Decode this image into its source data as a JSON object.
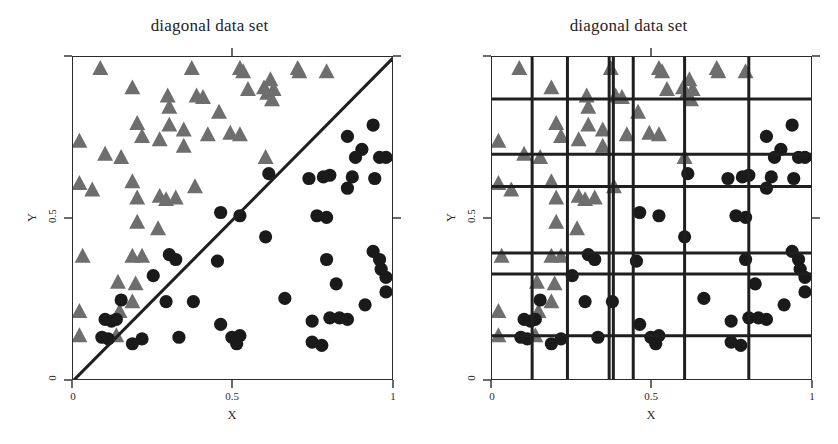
{
  "figure": {
    "width": 838,
    "height": 444,
    "background": "#ffffff"
  },
  "panels": [
    {
      "id": "left",
      "title": "diagonal data set",
      "xlabel": "X",
      "ylabel": "Y",
      "xticks": [
        "0",
        "0.5",
        "1"
      ],
      "yticks": [
        "0",
        "0.5",
        "1"
      ],
      "has_decision_line": true,
      "has_grid_partition": false
    },
    {
      "id": "right",
      "title": "diagonal data set",
      "xlabel": "X",
      "ylabel": "Y",
      "xticks": [
        "0",
        "0.5",
        "1"
      ],
      "yticks": [
        "0",
        "0.5",
        "1"
      ],
      "has_decision_line": false,
      "has_grid_partition": true
    }
  ],
  "chart_data": {
    "type": "scatter",
    "title": "diagonal data set",
    "xlabel": "X",
    "ylabel": "Y",
    "xlim": [
      0,
      1
    ],
    "ylim": [
      0,
      1
    ],
    "xticks": [
      0,
      0.5,
      1
    ],
    "yticks": [
      0,
      0.5,
      1
    ],
    "xtick_labels": [
      "0",
      "0.5",
      "1"
    ],
    "ytick_labels": [
      "0",
      "0.5",
      "1"
    ],
    "grid": false,
    "legend": "none",
    "colors": {
      "class_triangle": "#6e6e6e",
      "class_circle": "#1a1a1a",
      "decision_line": "#1f1f1f",
      "partition_line": "#1f1f1f",
      "axis": "#2b2b2b",
      "background": "#ffffff"
    },
    "series": [
      {
        "name": "class A",
        "marker": "triangle",
        "color": "#6e6e6e",
        "points": [
          [
            0.085,
            0.965
          ],
          [
            0.185,
            0.905
          ],
          [
            0.295,
            0.88
          ],
          [
            0.3,
            0.845
          ],
          [
            0.37,
            0.965
          ],
          [
            0.385,
            0.88
          ],
          [
            0.405,
            0.875
          ],
          [
            0.455,
            0.83
          ],
          [
            0.52,
            0.965
          ],
          [
            0.53,
            0.955
          ],
          [
            0.545,
            0.9
          ],
          [
            0.595,
            0.905
          ],
          [
            0.605,
            0.888
          ],
          [
            0.615,
            0.93
          ],
          [
            0.62,
            0.868
          ],
          [
            0.625,
            0.9
          ],
          [
            0.7,
            0.965
          ],
          [
            0.705,
            0.955
          ],
          [
            0.79,
            0.955
          ],
          [
            0.2,
            0.795
          ],
          [
            0.3,
            0.79
          ],
          [
            0.215,
            0.755
          ],
          [
            0.27,
            0.745
          ],
          [
            0.02,
            0.74
          ],
          [
            0.1,
            0.7
          ],
          [
            0.15,
            0.69
          ],
          [
            0.345,
            0.775
          ],
          [
            0.42,
            0.76
          ],
          [
            0.49,
            0.765
          ],
          [
            0.52,
            0.76
          ],
          [
            0.345,
            0.725
          ],
          [
            0.6,
            0.69
          ],
          [
            0.02,
            0.61
          ],
          [
            0.06,
            0.59
          ],
          [
            0.185,
            0.615
          ],
          [
            0.2,
            0.565
          ],
          [
            0.27,
            0.57
          ],
          [
            0.29,
            0.56
          ],
          [
            0.32,
            0.565
          ],
          [
            0.38,
            0.6
          ],
          [
            0.2,
            0.49
          ],
          [
            0.265,
            0.47
          ],
          [
            0.03,
            0.385
          ],
          [
            0.185,
            0.385
          ],
          [
            0.215,
            0.385
          ],
          [
            0.14,
            0.305
          ],
          [
            0.195,
            0.3
          ],
          [
            0.185,
            0.245
          ],
          [
            0.02,
            0.215
          ],
          [
            0.145,
            0.215
          ],
          [
            0.02,
            0.14
          ],
          [
            0.135,
            0.14
          ]
        ]
      },
      {
        "name": "class B",
        "marker": "circle",
        "color": "#1a1a1a",
        "points": [
          [
            0.935,
            0.79
          ],
          [
            0.855,
            0.755
          ],
          [
            0.9,
            0.715
          ],
          [
            0.955,
            0.69
          ],
          [
            0.88,
            0.69
          ],
          [
            0.975,
            0.69
          ],
          [
            0.61,
            0.64
          ],
          [
            0.735,
            0.625
          ],
          [
            0.78,
            0.63
          ],
          [
            0.8,
            0.635
          ],
          [
            0.87,
            0.63
          ],
          [
            0.94,
            0.625
          ],
          [
            0.855,
            0.595
          ],
          [
            0.46,
            0.52
          ],
          [
            0.52,
            0.51
          ],
          [
            0.76,
            0.51
          ],
          [
            0.79,
            0.505
          ],
          [
            0.6,
            0.445
          ],
          [
            0.935,
            0.4
          ],
          [
            0.955,
            0.375
          ],
          [
            0.96,
            0.345
          ],
          [
            0.3,
            0.39
          ],
          [
            0.32,
            0.375
          ],
          [
            0.45,
            0.37
          ],
          [
            0.79,
            0.375
          ],
          [
            0.975,
            0.32
          ],
          [
            0.25,
            0.325
          ],
          [
            0.82,
            0.3
          ],
          [
            0.975,
            0.275
          ],
          [
            0.66,
            0.255
          ],
          [
            0.15,
            0.25
          ],
          [
            0.29,
            0.245
          ],
          [
            0.375,
            0.245
          ],
          [
            0.91,
            0.235
          ],
          [
            0.1,
            0.19
          ],
          [
            0.12,
            0.185
          ],
          [
            0.135,
            0.19
          ],
          [
            0.745,
            0.185
          ],
          [
            0.8,
            0.195
          ],
          [
            0.83,
            0.195
          ],
          [
            0.855,
            0.19
          ],
          [
            0.46,
            0.175
          ],
          [
            0.09,
            0.135
          ],
          [
            0.11,
            0.13
          ],
          [
            0.185,
            0.115
          ],
          [
            0.215,
            0.13
          ],
          [
            0.33,
            0.135
          ],
          [
            0.495,
            0.135
          ],
          [
            0.51,
            0.115
          ],
          [
            0.52,
            0.14
          ],
          [
            0.745,
            0.12
          ],
          [
            0.775,
            0.11
          ]
        ]
      }
    ],
    "decision_line": {
      "type": "line",
      "points": [
        [
          0.0,
          0.0
        ],
        [
          1.0,
          1.0
        ]
      ],
      "color": "#1f1f1f",
      "width": 3
    },
    "partition": {
      "description": "axis-aligned decision-tree partition overlay on right panel",
      "vertical_splits": [
        0.125,
        0.235,
        0.365,
        0.378,
        0.44,
        0.6,
        0.8
      ],
      "horizontal_splits": [
        0.14,
        0.33,
        0.395,
        0.6,
        0.7,
        0.87
      ],
      "color": "#1f1f1f",
      "width": 3
    }
  }
}
